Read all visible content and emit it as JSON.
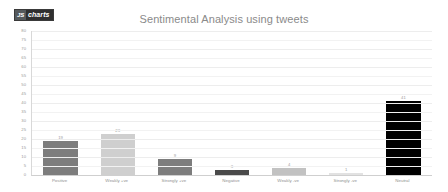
{
  "logo": {
    "mark": "JS",
    "word": "charts",
    "name": "js-charts-logo"
  },
  "chart_data": {
    "type": "bar",
    "title": "Sentimental Analysis using tweets",
    "xlabel": "",
    "ylabel": "",
    "categories": [
      "Positive",
      "Weakly +ve",
      "Strongly +ve",
      "Negative",
      "Weakly -ve",
      "Strongly -ve",
      "Neutral"
    ],
    "values": [
      19,
      23,
      9,
      3,
      4,
      1,
      41
    ],
    "bar_colors": [
      "#7d7d7d",
      "#cfcfcf",
      "#7d7d7d",
      "#4a4a4a",
      "#c2c2c2",
      "#e2e2e2",
      "#000000"
    ],
    "ylim": [
      0,
      80
    ],
    "ytick_step": 5,
    "yticks": [
      0,
      5,
      10,
      15,
      20,
      25,
      30,
      35,
      40,
      45,
      50,
      55,
      60,
      65,
      70,
      75,
      80
    ],
    "grid": true,
    "legend": false,
    "data_labels": true,
    "title_color": "#8a8a8a",
    "axis_text_color": "#9a9a9a",
    "grid_color": "#f2f2f2",
    "background": "#ffffff"
  }
}
